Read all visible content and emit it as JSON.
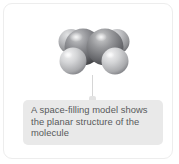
{
  "card": {
    "background_color": "#ffffff",
    "border_color": "#ededed"
  },
  "molecule": {
    "icon_name": "space-filling-molecular-model",
    "identity": "ethene",
    "formula": "C2H4",
    "geometry": "planar",
    "carbon_color": "#6d6e70",
    "hydrogen_color": "#bcbdbf",
    "atoms": [
      {
        "element": "C",
        "role": "carbon-left",
        "color": "#6d6e70"
      },
      {
        "element": "C",
        "role": "carbon-right",
        "color": "#707173"
      },
      {
        "element": "H",
        "role": "hydrogen-upper-left",
        "color": "#a9aaac"
      },
      {
        "element": "H",
        "role": "hydrogen-upper-right",
        "color": "#a7a8aa"
      },
      {
        "element": "H",
        "role": "hydrogen-lower-left",
        "color": "#c6c7c9"
      },
      {
        "element": "H",
        "role": "hydrogen-lower-right",
        "color": "#c3c4c6"
      }
    ]
  },
  "connector": {
    "icon_name": "callout-connector-line",
    "color": "#d6d6d6"
  },
  "caption": {
    "background_color": "#e9e9e9",
    "text_color": "#58595b",
    "full_text": "A space-filling model shows the planar structure of the molecule",
    "lines": [
      "A space-filling model shows",
      "the planar structure of the",
      "molecule"
    ]
  }
}
